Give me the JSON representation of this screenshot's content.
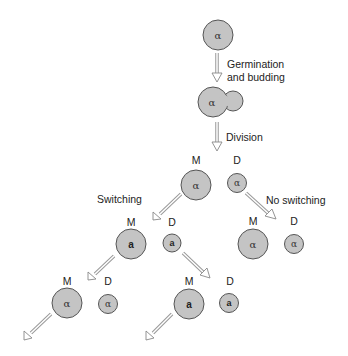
{
  "diagram": {
    "steps": {
      "germination_label_line1": "Germination",
      "germination_label_line2": "and budding",
      "division_label": "Division",
      "switching_label": "Switching",
      "no_switching_label": "No switching"
    },
    "labels": {
      "mother": "M",
      "daughter": "D"
    },
    "mating_types": {
      "alpha": "α",
      "a": "a"
    },
    "colors": {
      "cell_fill": "#c4c4c4",
      "cell_stroke": "#555555",
      "arrow": "#999999"
    },
    "nodes": [
      {
        "id": "spore",
        "type": "alpha",
        "role": ""
      },
      {
        "id": "budding",
        "type": "alpha",
        "role": ""
      },
      {
        "id": "gen1-M",
        "type": "alpha",
        "role": "M"
      },
      {
        "id": "gen1-D",
        "type": "alpha",
        "role": "D"
      },
      {
        "id": "gen2-left-M",
        "type": "a",
        "role": "M"
      },
      {
        "id": "gen2-left-D",
        "type": "a",
        "role": "D"
      },
      {
        "id": "gen2-right-M",
        "type": "alpha",
        "role": "M"
      },
      {
        "id": "gen2-right-D",
        "type": "alpha",
        "role": "D"
      },
      {
        "id": "gen3-left-M",
        "type": "alpha",
        "role": "M"
      },
      {
        "id": "gen3-left-D",
        "type": "alpha",
        "role": "D"
      },
      {
        "id": "gen3-mid-M",
        "type": "a",
        "role": "M"
      },
      {
        "id": "gen3-mid-D",
        "type": "a",
        "role": "D"
      }
    ]
  }
}
